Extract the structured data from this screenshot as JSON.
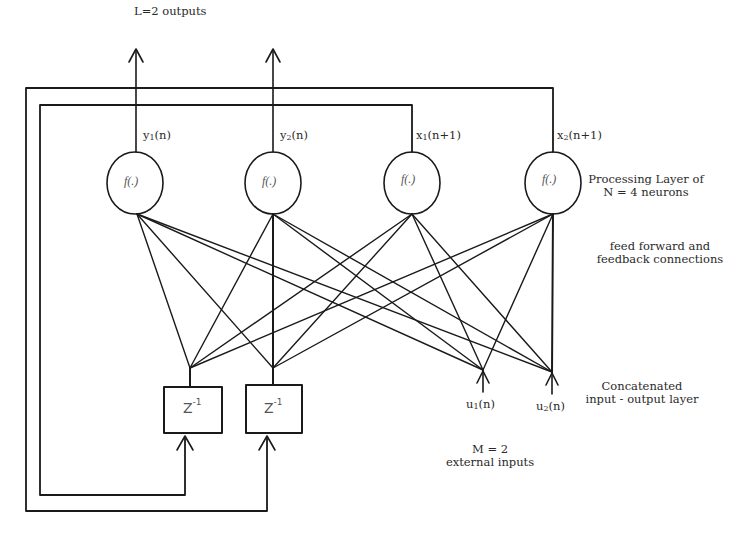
{
  "diagram": {
    "outputs_label": "L=2 outputs",
    "neurons": [
      {
        "id": "n1",
        "function": "f(.)",
        "output_label": "y",
        "output_sub": "1",
        "output_suffix": "(n)",
        "cx": 135,
        "cy": 183
      },
      {
        "id": "n2",
        "function": "f(.)",
        "output_label": "y",
        "output_sub": "2",
        "output_suffix": "(n)",
        "cx": 273,
        "cy": 183
      },
      {
        "id": "n3",
        "function": "f(.)",
        "output_label": "x",
        "output_sub": "1",
        "output_suffix": "(n+1)",
        "cx": 412,
        "cy": 183
      },
      {
        "id": "n4",
        "function": "f(.)",
        "output_label": "x",
        "output_sub": "2",
        "output_suffix": "(n+1)",
        "cx": 553,
        "cy": 183
      }
    ],
    "delay_units": [
      {
        "id": "z1",
        "label": "Z",
        "exponent": "-1"
      },
      {
        "id": "z2",
        "label": "Z",
        "exponent": "-1"
      }
    ],
    "inputs": [
      {
        "id": "u1",
        "label": "u",
        "sub": "1",
        "suffix": "(n)"
      },
      {
        "id": "u2",
        "label": "u",
        "sub": "2",
        "suffix": "(n)"
      }
    ],
    "annotations": {
      "processing_layer_line1": "Processing Layer of",
      "processing_layer_line2": "N = 4 neurons",
      "connections_line1": "feed forward and",
      "connections_line2": "feedback connections",
      "concat_line1": "Concatenated",
      "concat_line2": "input - output layer",
      "external_line1": "M = 2",
      "external_line2": "external inputs"
    },
    "colors": {
      "line": "#1a1a1a",
      "text": "#2a2a2a",
      "background": "#ffffff"
    }
  }
}
